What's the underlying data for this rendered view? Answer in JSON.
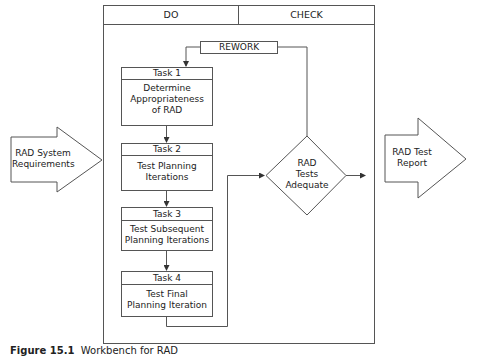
{
  "diagram": {
    "columns": [
      {
        "label": "DO"
      },
      {
        "label": "CHECK"
      }
    ],
    "rework_label": "REWORK",
    "input": {
      "label": "RAD System Requirements",
      "lines": [
        "RAD System",
        "Requirements"
      ]
    },
    "output": {
      "label": "RAD Test Report",
      "lines": [
        "RAD Test",
        "Report"
      ]
    },
    "tasks": [
      {
        "title": "Task 1",
        "lines": [
          "Determine",
          "Appropriateness",
          "of RAD"
        ]
      },
      {
        "title": "Task 2",
        "lines": [
          "Test Planning",
          "Iterations"
        ]
      },
      {
        "title": "Task 3",
        "lines": [
          "Test Subsequent",
          "Planning Iterations"
        ]
      },
      {
        "title": "Task 4",
        "lines": [
          "Test Final",
          "Planning Iteration"
        ]
      }
    ],
    "decision": {
      "lines": [
        "RAD",
        "Tests",
        "Adequate"
      ]
    },
    "colors": {
      "stroke": "#555555",
      "background": "#ffffff",
      "text": "#222222"
    }
  },
  "caption": {
    "prefix": "Figure 15.1",
    "text": "Workbench for RAD"
  }
}
